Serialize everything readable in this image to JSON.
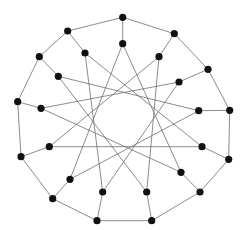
{
  "diagram": {
    "type": "graph",
    "width": 247,
    "height": 230,
    "style": {
      "node_color": "#111111",
      "edge_color": "#6e6e6e",
      "node_radius": 3.6,
      "edge_width": 0.8,
      "background": "#ffffff"
    },
    "outer_nodes": [
      {
        "id": "O0",
        "x": 122.7,
        "y": 17.3
      },
      {
        "id": "O1",
        "x": 174.3,
        "y": 33.7
      },
      {
        "id": "O2",
        "x": 208.0,
        "y": 69.3
      },
      {
        "id": "O3",
        "x": 229.7,
        "y": 110.3
      },
      {
        "id": "O4",
        "x": 228.7,
        "y": 159.3
      },
      {
        "id": "O5",
        "x": 200.0,
        "y": 192.0
      },
      {
        "id": "O6",
        "x": 151.7,
        "y": 220.7
      },
      {
        "id": "O7",
        "x": 97.0,
        "y": 220.7
      },
      {
        "id": "O8",
        "x": 52.7,
        "y": 198.7
      },
      {
        "id": "O9",
        "x": 21.0,
        "y": 156.7
      },
      {
        "id": "O10",
        "x": 17.7,
        "y": 101.7
      },
      {
        "id": "O11",
        "x": 39.3,
        "y": 56.7
      },
      {
        "id": "O12",
        "x": 67.7,
        "y": 31.0
      }
    ],
    "inner_nodes": [
      {
        "id": "I0",
        "x": 122.7,
        "y": 43.7
      },
      {
        "id": "I1",
        "x": 159.0,
        "y": 56.7
      },
      {
        "id": "I2",
        "x": 179.0,
        "y": 82.0
      },
      {
        "id": "I3",
        "x": 198.7,
        "y": 110.7
      },
      {
        "id": "I4",
        "x": 202.0,
        "y": 146.7
      },
      {
        "id": "I5",
        "x": 181.0,
        "y": 172.3
      },
      {
        "id": "I6",
        "x": 146.7,
        "y": 192.0
      },
      {
        "id": "I7",
        "x": 102.7,
        "y": 192.0
      },
      {
        "id": "I8",
        "x": 70.0,
        "y": 179.3
      },
      {
        "id": "I9",
        "x": 49.3,
        "y": 146.7
      },
      {
        "id": "I10",
        "x": 41.0,
        "y": 108.3
      },
      {
        "id": "I11",
        "x": 58.3,
        "y": 76.3
      },
      {
        "id": "I12",
        "x": 85.0,
        "y": 53.0
      }
    ],
    "edge_rules": {
      "outer_cycle": "O_i -- O_(i+1 mod 13)",
      "spokes": "O_i -- I_i",
      "inner_star": "I_i -- I_(i+5 mod 13)"
    }
  }
}
